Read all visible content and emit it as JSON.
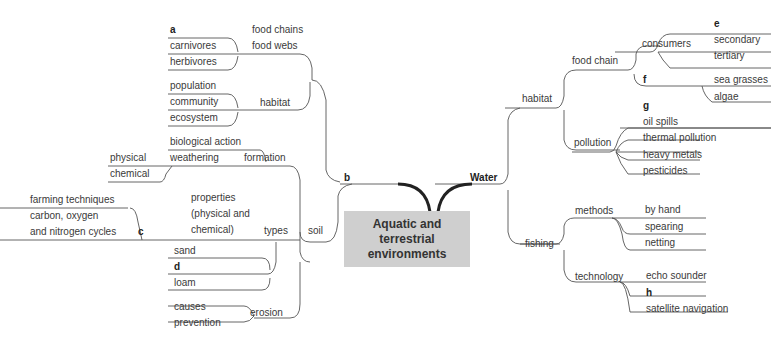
{
  "center": {
    "line1": "Aquatic and terrestrial",
    "line2": "environments"
  },
  "left": {
    "root": "b",
    "ecology": {
      "a": "a",
      "carnivores": "carnivores",
      "herbivores": "herbivores",
      "food_chains": "food chains",
      "food_webs": "food webs",
      "population": "population",
      "community": "community",
      "ecosystem": "ecosystem",
      "habitat": "habitat"
    },
    "soil": {
      "label": "soil",
      "biological_action": "biological action",
      "weathering": "weathering",
      "formation": "formation",
      "physical": "physical",
      "chemical": "chemical",
      "properties1": "properties",
      "properties2": "(physical and",
      "properties3": "chemical)",
      "types": "types",
      "farming": "farming techniques",
      "cycles1": "carbon, oxygen",
      "cycles2": "and nitrogen cycles",
      "c": "c",
      "sand": "sand",
      "d": "d",
      "loam": "loam",
      "causes": "causes",
      "prevention": "prevention",
      "erosion": "erosion"
    }
  },
  "right": {
    "root": "Water",
    "habitat": "habitat",
    "food_chain": "food chain",
    "consumers": "consumers",
    "e": "e",
    "secondary": "secondary",
    "tertiary": "tertiary",
    "f": "f",
    "sea_grasses": "sea grasses",
    "algae": "algae",
    "pollution": "pollution",
    "g": "g",
    "oil_spills": "oil spills",
    "thermal": "thermal pollution",
    "heavy_metals": "heavy metals",
    "pesticides": "pesticides",
    "fishing": "fishing",
    "methods": "methods",
    "by_hand": "by hand",
    "spearing": "spearing",
    "netting": "netting",
    "technology": "technology",
    "echo": "echo sounder",
    "h": "h",
    "satellite": "satellite navigation"
  }
}
